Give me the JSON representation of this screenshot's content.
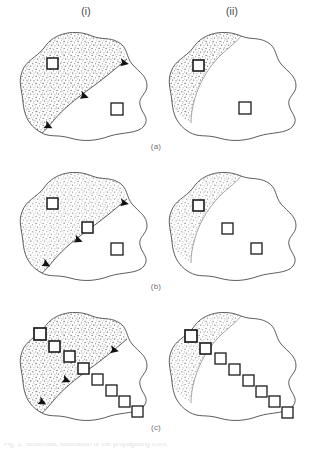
{
  "figure": {
    "type": "scientific-diagram",
    "panel_count": 6,
    "column_labels": [
      {
        "id": "i",
        "text": "(i)",
        "x": 86,
        "y": 12
      },
      {
        "id": "ii",
        "text": "(ii)",
        "x": 232,
        "y": 12
      }
    ],
    "row_labels": [
      {
        "id": "a",
        "text": "(a)",
        "x": 156,
        "y": 147
      },
      {
        "id": "b",
        "text": "(b)",
        "x": 156,
        "y": 287
      },
      {
        "id": "c",
        "text": "(c)",
        "x": 156,
        "y": 428
      }
    ],
    "bottom_caption": {
      "text": "Fig. 1.  Schematic illustration of the propagating front.",
      "visible": "cropped"
    },
    "colors": {
      "outline": "#4a4a4a",
      "stipple_dot": "#5a5a5a",
      "stipple_fill": "#ffffff",
      "square_stroke": "#1a1a1a",
      "square_fill": "#ffffff",
      "arrow_fill": "#111111",
      "background": "#ffffff",
      "label_text": "#3a3a3a",
      "row_label_text": "#707070"
    },
    "panels": [
      {
        "row": "a",
        "column": "i",
        "name": "panel-a-i",
        "has_front_arrows": true,
        "arrow_count": 3,
        "square_count": 2,
        "squares_in_shaded": 1,
        "squares_on_front": 0,
        "squares_outside": 1,
        "shaded_region": "large-upper-left-lobe"
      },
      {
        "row": "a",
        "column": "ii",
        "name": "panel-a-ii",
        "has_front_arrows": false,
        "arrow_count": 0,
        "square_count": 2,
        "squares_in_shaded": 1,
        "squares_on_front": 0,
        "squares_outside": 1,
        "shaded_region": "narrow-left-crescent"
      },
      {
        "row": "b",
        "column": "i",
        "name": "panel-b-i",
        "has_front_arrows": true,
        "arrow_count": 3,
        "square_count": 3,
        "squares_in_shaded": 1,
        "squares_on_front": 1,
        "squares_outside": 1,
        "shaded_region": "large-upper-left-lobe"
      },
      {
        "row": "b",
        "column": "ii",
        "name": "panel-b-ii",
        "has_front_arrows": false,
        "arrow_count": 0,
        "square_count": 3,
        "squares_in_shaded": 1,
        "squares_on_front": 0,
        "squares_outside": 2,
        "shaded_region": "narrow-left-crescent"
      },
      {
        "row": "c",
        "column": "i",
        "name": "panel-c-i",
        "has_front_arrows": true,
        "arrow_count": 3,
        "square_count": 8,
        "squares_in_shaded": 3,
        "squares_on_front": 1,
        "squares_outside": 4,
        "shaded_region": "large-upper-left-lobe"
      },
      {
        "row": "c",
        "column": "ii",
        "name": "panel-c-ii",
        "has_front_arrows": false,
        "arrow_count": 0,
        "square_count": 8,
        "squares_in_shaded": 1,
        "squares_on_front": 1,
        "squares_outside": 6,
        "shaded_region": "narrow-left-crescent"
      }
    ]
  }
}
